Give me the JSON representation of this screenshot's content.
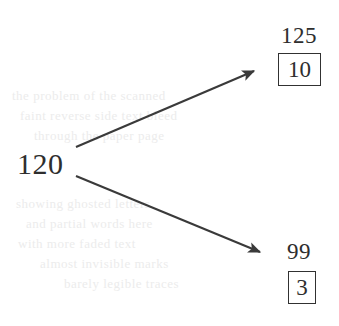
{
  "diagram": {
    "type": "branching-arrow-diagram",
    "source": {
      "label": "120"
    },
    "branches": [
      {
        "name": "upper",
        "value_label": "125",
        "boxed_value": "10",
        "arrow": {
          "from_x": 76,
          "from_y": 147,
          "to_x": 258,
          "to_y": 69
        }
      },
      {
        "name": "lower",
        "value_label": "99",
        "boxed_value": "3",
        "arrow": {
          "from_x": 76,
          "from_y": 176,
          "to_x": 264,
          "to_y": 254
        }
      }
    ],
    "colors": {
      "ink": "#2e2e2e",
      "line": "#3a3a3a",
      "box_border": "#313131",
      "background": "#ffffff",
      "bleed_through": "#ececec"
    },
    "background_artifacts": [
      {
        "text": "the problem of the scanned",
        "x": 12,
        "y": 88
      },
      {
        "text": "faint reverse side text bleed",
        "x": 20,
        "y": 108
      },
      {
        "text": "through the paper page",
        "x": 34,
        "y": 128
      },
      {
        "text": "showing ghosted letters",
        "x": 16,
        "y": 196
      },
      {
        "text": "and partial words here",
        "x": 26,
        "y": 216
      },
      {
        "text": "with more faded text",
        "x": 18,
        "y": 236
      },
      {
        "text": "almost invisible marks",
        "x": 40,
        "y": 256
      },
      {
        "text": "barely legible traces",
        "x": 64,
        "y": 276
      }
    ]
  }
}
